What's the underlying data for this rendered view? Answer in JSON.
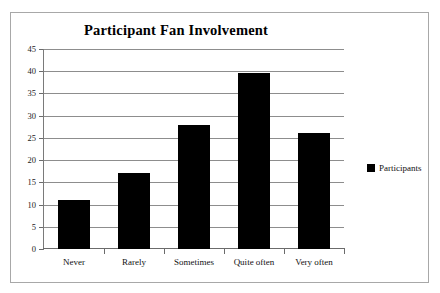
{
  "chart_data": {
    "type": "bar",
    "title": "Participant Fan Involvement",
    "xlabel": "",
    "ylabel": "",
    "categories": [
      "Never",
      "Rarely",
      "Sometimes",
      "Quite often",
      "Very often"
    ],
    "values": [
      11,
      17,
      28,
      39.5,
      26
    ],
    "series": [
      {
        "name": "Participants",
        "values": [
          11,
          17,
          28,
          39.5,
          26
        ],
        "color": "#000000"
      }
    ],
    "ylim": [
      0,
      45
    ],
    "ytick_step": 5,
    "yticks": [
      45,
      40,
      35,
      30,
      25,
      20,
      15,
      10,
      5,
      0
    ],
    "ytick_labels": [
      "45",
      "40",
      "35",
      "30",
      "25",
      "20",
      "15",
      "10",
      "5",
      "0"
    ],
    "grid": true,
    "grid_axis": "y",
    "legend": {
      "position": "right",
      "entries": [
        {
          "label": "Participants",
          "color": "#000000"
        }
      ]
    },
    "frame": true,
    "background_color": "#ffffff",
    "axis_color": "#7a7a7a",
    "gridline_color": "#8d8d8d",
    "border_color": "#a8a8a8"
  }
}
